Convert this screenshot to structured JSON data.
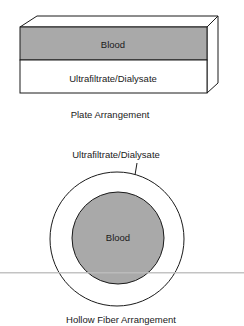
{
  "plate": {
    "blood_label": "Blood",
    "dialysate_label": "Ultrafiltrate/Dialysate",
    "caption": "Plate Arrangement"
  },
  "fiber": {
    "dialysate_label": "Ultrafiltrate/Dialysate",
    "blood_label": "Blood",
    "caption": "Hollow Fiber Arrangement"
  },
  "colors": {
    "blood_fill": "#a9a9a9",
    "line": "#1a1a1a",
    "scan_line": "#bdbdbd"
  }
}
